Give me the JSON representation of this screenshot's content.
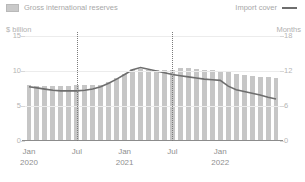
{
  "legend": {
    "bar_series_label": "Gross international reserves",
    "bar_swatch_icon": "bar-swatch-icon",
    "line_series_label": "Import cover",
    "line_swatch_icon": "line-swatch-icon"
  },
  "axes": {
    "left_unit": "$ billion",
    "right_unit": "Months",
    "left_ticks": [
      "15",
      "10",
      "5",
      "0"
    ],
    "right_ticks": [
      "18",
      "12",
      "6",
      "0"
    ],
    "x_labels": [
      {
        "label": "Jan",
        "year": "2020"
      },
      {
        "label": "Jul",
        "year": ""
      },
      {
        "label": "Jan",
        "year": "2021"
      },
      {
        "label": "Jul",
        "year": ""
      },
      {
        "label": "Jan",
        "year": "2022"
      }
    ]
  },
  "colors": {
    "bar": "#c6c6c6",
    "line": "#6e6e6e",
    "grid": "#ececec",
    "axis": "#8c8c8c",
    "text": "#9a9a9a",
    "marker": "#7b7b7b"
  },
  "chart_data": {
    "type": "bar",
    "title": "",
    "subtitle": "",
    "xlabel": "",
    "ylabel": "$ billion",
    "y2label": "Months",
    "ylim": [
      0,
      15
    ],
    "y2lim": [
      0,
      18
    ],
    "grid": true,
    "legend_position": "top",
    "categories": [
      "Jan 2020",
      "Feb 2020",
      "Mar 2020",
      "Apr 2020",
      "May 2020",
      "Jun 2020",
      "Jul 2020",
      "Aug 2020",
      "Sep 2020",
      "Oct 2020",
      "Nov 2020",
      "Dec 2020",
      "Jan 2021",
      "Feb 2021",
      "Mar 2021",
      "Apr 2021",
      "May 2021",
      "Jun 2021",
      "Jul 2021",
      "Aug 2021",
      "Sep 2021",
      "Oct 2021",
      "Nov 2021",
      "Dec 2021",
      "Jan 2022",
      "Feb 2022",
      "Mar 2022",
      "Apr 2022",
      "May 2022",
      "Jun 2022",
      "Jul 2022",
      "Aug 2022"
    ],
    "series": [
      {
        "name": "Gross international reserves",
        "type": "bar",
        "axis": "left",
        "unit": "$ billion",
        "values": [
          8.0,
          7.9,
          7.8,
          7.9,
          7.9,
          7.9,
          8.0,
          8.0,
          8.0,
          8.0,
          8.4,
          9.0,
          9.6,
          10.3,
          10.3,
          10.2,
          10.2,
          10.2,
          10.2,
          10.4,
          10.4,
          10.3,
          10.2,
          10.1,
          10.0,
          9.8,
          9.6,
          9.4,
          9.3,
          9.2,
          9.1,
          9.0
        ]
      },
      {
        "name": "Import cover",
        "type": "line",
        "axis": "right",
        "unit": "Months",
        "values": [
          9.3,
          9.1,
          8.9,
          8.7,
          8.6,
          8.6,
          8.6,
          8.7,
          8.9,
          9.3,
          9.9,
          10.6,
          11.4,
          12.2,
          12.6,
          12.3,
          12.0,
          11.7,
          11.4,
          11.2,
          11.0,
          10.8,
          10.6,
          10.5,
          10.4,
          9.4,
          8.8,
          8.5,
          8.2,
          7.9,
          7.5,
          7.2
        ]
      }
    ],
    "markers": [
      {
        "at": "Jul 2020",
        "style": "dotted-vertical"
      },
      {
        "at": "Jul 2021",
        "style": "dotted-vertical"
      }
    ]
  }
}
